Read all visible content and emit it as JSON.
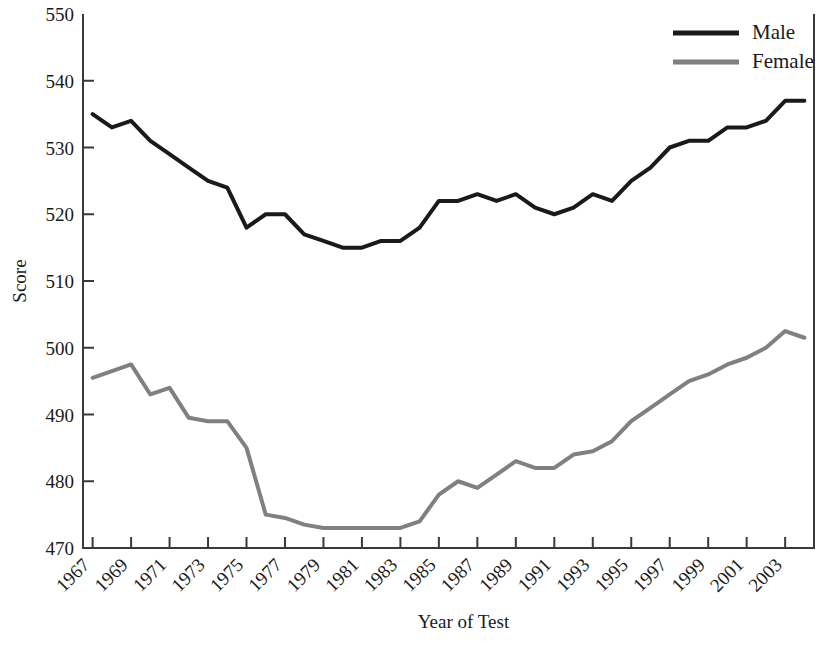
{
  "chart_data": {
    "type": "line",
    "title": "",
    "xlabel": "Year of Test",
    "ylabel": "Score",
    "xlim": [
      1966.5,
      2004.5
    ],
    "ylim": [
      470,
      550
    ],
    "ytick_step": 10,
    "yticks": [
      470,
      480,
      490,
      500,
      510,
      520,
      530,
      540,
      550
    ],
    "xticks": [
      1967,
      1969,
      1971,
      1973,
      1975,
      1977,
      1979,
      1981,
      1983,
      1985,
      1987,
      1989,
      1991,
      1993,
      1995,
      1997,
      1999,
      2001,
      2003
    ],
    "xtick_labels": [
      "1967",
      "1969",
      "1971",
      "1973",
      "1975",
      "1977",
      "1979",
      "1981",
      "1983",
      "1985",
      "1987",
      "1989",
      "1991",
      "1993",
      "1995",
      "1997",
      "1999",
      "2001",
      "2003"
    ],
    "xtick_rotation": 45,
    "grid": false,
    "legend_position": "top-right",
    "x": [
      1967,
      1968,
      1969,
      1970,
      1971,
      1972,
      1973,
      1974,
      1975,
      1976,
      1977,
      1978,
      1979,
      1980,
      1981,
      1982,
      1983,
      1984,
      1985,
      1986,
      1987,
      1988,
      1989,
      1990,
      1991,
      1992,
      1993,
      1994,
      1995,
      1996,
      1997,
      1998,
      1999,
      2000,
      2001,
      2002,
      2003,
      2004
    ],
    "series": [
      {
        "name": "Male",
        "color": "#1a1a1a",
        "line_width": 4,
        "values": [
          535,
          533,
          534,
          531,
          529,
          527,
          525,
          524,
          518,
          520,
          520,
          517,
          516,
          515,
          515,
          516,
          516,
          518,
          522,
          522,
          523,
          522,
          523,
          521,
          520,
          521,
          523,
          522,
          525,
          527,
          530,
          531,
          531,
          533,
          533,
          534,
          537,
          537
        ]
      },
      {
        "name": "Female",
        "color": "#808080",
        "line_width": 4,
        "values": [
          495.5,
          496.5,
          497.5,
          493,
          494,
          489.5,
          489,
          489,
          485,
          475,
          474.5,
          473.5,
          473,
          473,
          473,
          473,
          473,
          474,
          478,
          480,
          479,
          481,
          483,
          482,
          482,
          484,
          484.5,
          486,
          489,
          491,
          493,
          495,
          496,
          497.5,
          498.5,
          500,
          502.5,
          501.5
        ]
      }
    ],
    "legend": [
      {
        "label": "Male",
        "color": "#1a1a1a"
      },
      {
        "label": "Female",
        "color": "#808080"
      }
    ]
  },
  "axes": {
    "y_title": "Score",
    "x_title": "Year of Test"
  }
}
